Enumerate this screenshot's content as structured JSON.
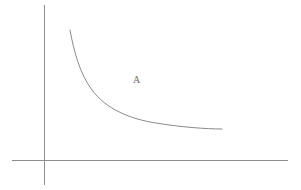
{
  "figure": {
    "title": "",
    "background_color": "#ffffff",
    "width": 301,
    "height": 190
  },
  "labels": {
    "curve_a": "A"
  },
  "colors": {
    "axis": "#8d8d8d",
    "curve": "#8a8a8a",
    "label_text": "#6e6e6e",
    "background": "#ffffff"
  },
  "chart_data": {
    "type": "line",
    "title": "",
    "xlabel": "",
    "ylabel": "",
    "grid": false,
    "legend": "none",
    "axes": {
      "y_axis": {
        "x": 44,
        "y_top": 5,
        "y_bottom": 185
      },
      "x_axis": {
        "y": 160,
        "x_left": 12,
        "x_right": 288
      },
      "origin": {
        "x": 44,
        "y": 160
      },
      "ticks": [],
      "tick_labels": []
    },
    "series": [
      {
        "name": "A",
        "label": "A",
        "label_position": {
          "x": 137,
          "y": 80
        },
        "shape": "convex-decreasing",
        "points": [
          {
            "x": 70,
            "y": 30
          },
          {
            "x": 74,
            "y": 48
          },
          {
            "x": 80,
            "y": 66
          },
          {
            "x": 88,
            "y": 82
          },
          {
            "x": 98,
            "y": 95
          },
          {
            "x": 110,
            "y": 105
          },
          {
            "x": 124,
            "y": 112
          },
          {
            "x": 140,
            "y": 118
          },
          {
            "x": 158,
            "y": 122
          },
          {
            "x": 178,
            "y": 126
          },
          {
            "x": 200,
            "y": 128
          },
          {
            "x": 222,
            "y": 129
          }
        ],
        "path": "M 70 30 C 74 52, 80 74, 92 90 C 106 109, 130 119, 156 123 C 180 127, 206 129, 222 129"
      }
    ]
  }
}
